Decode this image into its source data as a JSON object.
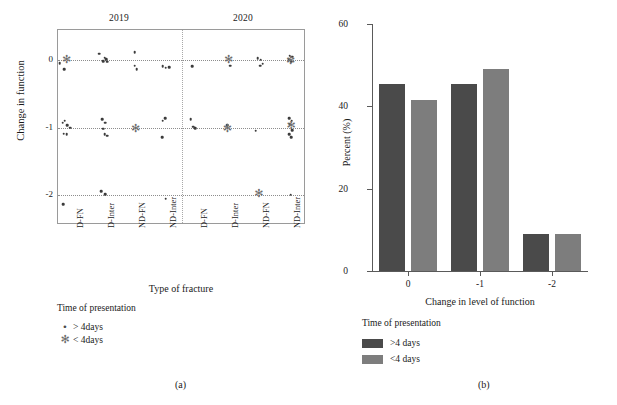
{
  "figure": {
    "caption_a": "(a)",
    "caption_b": "(b)"
  },
  "panel_a": {
    "group_labels": [
      "2019",
      "2020"
    ],
    "y_title": "Change in function",
    "x_title": "Type of fracture",
    "y_ticks": [
      "0",
      "-1",
      "-2"
    ],
    "x_ticks": [
      "D-FN",
      "D-Inter",
      "ND-FN",
      "ND-Inter",
      "D-FN",
      "D-Inter",
      "ND-FN",
      "ND-Inter"
    ],
    "legend": {
      "title": "Time of presentation",
      "items": [
        {
          "marker": "dot",
          "glyph": "•",
          "label": "> 4days"
        },
        {
          "marker": "asterisk",
          "glyph": "✻",
          "label": "< 4days"
        }
      ]
    },
    "chart_data": {
      "type": "scatter",
      "title": "",
      "xlabel": "Type of fracture",
      "ylabel": "Change in function",
      "ylim": [
        -2.45,
        0.45
      ],
      "grid": true,
      "y_gridlines": [
        0,
        -1,
        -2
      ],
      "categories": [
        "D-FN",
        "D-Inter",
        "ND-FN",
        "ND-Inter",
        "D-FN",
        "D-Inter",
        "ND-FN",
        "ND-Inter"
      ],
      "category_years": [
        "2019",
        "2019",
        "2019",
        "2019",
        "2020",
        "2020",
        "2020",
        "2020"
      ],
      "series": [
        {
          "name": "> 4days",
          "marker": "dot",
          "points": [
            {
              "cat": 0,
              "jitter": -0.45,
              "y": -0.04
            },
            {
              "cat": 0,
              "jitter": -0.3,
              "y": -0.13
            },
            {
              "cat": 0,
              "jitter": -0.35,
              "y": -0.93
            },
            {
              "cat": 0,
              "jitter": -0.28,
              "y": -0.9
            },
            {
              "cat": 0,
              "jitter": -0.2,
              "y": -0.97
            },
            {
              "cat": 0,
              "jitter": -0.1,
              "y": -1.0
            },
            {
              "cat": 0,
              "jitter": -0.32,
              "y": -1.09
            },
            {
              "cat": 0,
              "jitter": -0.22,
              "y": -1.1
            },
            {
              "cat": 0,
              "jitter": -0.33,
              "y": -2.14
            },
            {
              "cat": 1,
              "jitter": -0.18,
              "y": 0.1
            },
            {
              "cat": 1,
              "jitter": 0.0,
              "y": 0.04
            },
            {
              "cat": 1,
              "jitter": 0.06,
              "y": 0.02
            },
            {
              "cat": 1,
              "jitter": -0.05,
              "y": -0.01
            },
            {
              "cat": 1,
              "jitter": 0.08,
              "y": -0.02
            },
            {
              "cat": 1,
              "jitter": -0.08,
              "y": -0.88
            },
            {
              "cat": 1,
              "jitter": 0.02,
              "y": -0.93
            },
            {
              "cat": 1,
              "jitter": -0.05,
              "y": -1.02
            },
            {
              "cat": 1,
              "jitter": 0.0,
              "y": -1.1
            },
            {
              "cat": 1,
              "jitter": 0.08,
              "y": -1.12
            },
            {
              "cat": 1,
              "jitter": -0.1,
              "y": -1.95
            },
            {
              "cat": 1,
              "jitter": 0.02,
              "y": -1.99
            },
            {
              "cat": 2,
              "jitter": -0.02,
              "y": 0.12
            },
            {
              "cat": 2,
              "jitter": -0.03,
              "y": -0.08
            },
            {
              "cat": 2,
              "jitter": 0.04,
              "y": -0.13
            },
            {
              "cat": 3,
              "jitter": -0.12,
              "y": -0.09
            },
            {
              "cat": 3,
              "jitter": -0.02,
              "y": -0.11
            },
            {
              "cat": 3,
              "jitter": 0.08,
              "y": -0.1
            },
            {
              "cat": 3,
              "jitter": -0.05,
              "y": -0.86
            },
            {
              "cat": 3,
              "jitter": -0.12,
              "y": -0.9
            },
            {
              "cat": 3,
              "jitter": -0.14,
              "y": -1.14
            },
            {
              "cat": 3,
              "jitter": -0.02,
              "y": -2.06
            },
            {
              "cat": 4,
              "jitter": -0.18,
              "y": -0.09
            },
            {
              "cat": 4,
              "jitter": -0.22,
              "y": -0.88
            },
            {
              "cat": 4,
              "jitter": -0.14,
              "y": -0.99
            },
            {
              "cat": 4,
              "jitter": -0.08,
              "y": -1.01
            },
            {
              "cat": 5,
              "jitter": 0.06,
              "y": -0.08
            },
            {
              "cat": 5,
              "jitter": -0.05,
              "y": -0.97
            },
            {
              "cat": 6,
              "jitter": -0.06,
              "y": 0.03
            },
            {
              "cat": 6,
              "jitter": 0.04,
              "y": 0.01
            },
            {
              "cat": 6,
              "jitter": 0.1,
              "y": -0.05
            },
            {
              "cat": 6,
              "jitter": 0.02,
              "y": -0.08
            },
            {
              "cat": 6,
              "jitter": -0.12,
              "y": -1.05
            },
            {
              "cat": 7,
              "jitter": -0.02,
              "y": 0.07
            },
            {
              "cat": 7,
              "jitter": 0.06,
              "y": 0.05
            },
            {
              "cat": 7,
              "jitter": -0.06,
              "y": 0.02
            },
            {
              "cat": 7,
              "jitter": 0.03,
              "y": -0.02
            },
            {
              "cat": 7,
              "jitter": -0.04,
              "y": -0.86
            },
            {
              "cat": 7,
              "jitter": 0.04,
              "y": -0.9
            },
            {
              "cat": 7,
              "jitter": -0.02,
              "y": -0.95
            },
            {
              "cat": 7,
              "jitter": 0.05,
              "y": -1.04
            },
            {
              "cat": 7,
              "jitter": -0.05,
              "y": -1.1
            },
            {
              "cat": 7,
              "jitter": 0.02,
              "y": -1.14
            },
            {
              "cat": 7,
              "jitter": 0.0,
              "y": -2.0
            }
          ]
        },
        {
          "name": "< 4days",
          "marker": "asterisk",
          "points": [
            {
              "cat": 0,
              "jitter": -0.22,
              "y": 0.02
            },
            {
              "cat": 2,
              "jitter": 0.0,
              "y": -1.0
            },
            {
              "cat": 5,
              "jitter": 0.0,
              "y": 0.02
            },
            {
              "cat": 5,
              "jitter": -0.04,
              "y": -1.0
            },
            {
              "cat": 6,
              "jitter": -0.02,
              "y": -1.98
            },
            {
              "cat": 7,
              "jitter": 0.0,
              "y": 0.0
            },
            {
              "cat": 7,
              "jitter": 0.02,
              "y": -0.96
            }
          ]
        }
      ]
    }
  },
  "panel_b": {
    "y_title": "Percent (%)",
    "x_title": "Change in level of function",
    "legend": {
      "title": "Time of presentation",
      "items": [
        {
          "label": ">4 days",
          "color": "#4a4a4a"
        },
        {
          "label": "<4 days",
          "color": "#7d7d7d"
        }
      ]
    },
    "chart_data": {
      "type": "bar",
      "title": "",
      "xlabel": "Change in level of function",
      "ylabel": "Percent (%)",
      "categories": [
        "0",
        "-1",
        "-2"
      ],
      "ylim": [
        0,
        60
      ],
      "y_ticks": [
        0,
        20,
        40,
        60
      ],
      "grid": false,
      "series": [
        {
          "name": ">4 days",
          "color": "#4a4a4a",
          "values": [
            45.5,
            45.5,
            9.0
          ]
        },
        {
          "name": "<4 days",
          "color": "#7d7d7d",
          "values": [
            41.5,
            49.0,
            9.0
          ]
        }
      ]
    }
  }
}
